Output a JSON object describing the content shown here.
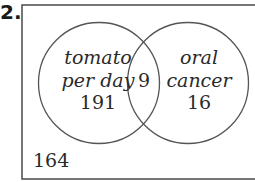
{
  "problem_number": "2.",
  "diagram": {
    "type": "venn",
    "sets": [
      {
        "name": "tomato per day",
        "label_lines": [
          "tomato",
          "per day"
        ],
        "only_count": "191"
      },
      {
        "name": "oral cancer",
        "label_lines": [
          "oral",
          "cancer"
        ],
        "only_count": "16"
      }
    ],
    "intersection_count": "9",
    "outside_count": "164",
    "colors": {
      "stroke": "#555555",
      "text": "#2a2a2a",
      "background": "#ffffff"
    }
  }
}
